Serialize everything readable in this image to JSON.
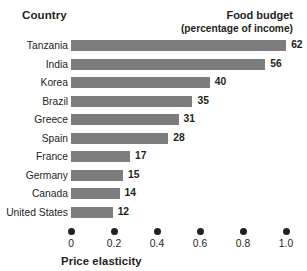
{
  "header": {
    "country_label": "Country",
    "budget_label_line1": "Food budget",
    "budget_label_line2": "(percentage of income)"
  },
  "axis": {
    "title": "Price elasticity",
    "tick_labels": [
      "0",
      "0.2",
      "0.4",
      "0.6",
      "0.8",
      "1.0"
    ]
  },
  "colors": {
    "bar": "#7d7d7d",
    "text": "#231f20",
    "background": "#ffffff"
  },
  "chart_data": {
    "type": "bar",
    "orientation": "horizontal",
    "title": "",
    "xlabel": "Price elasticity",
    "ylabel": "Country",
    "value_axis_label": "Food budget (percentage of income)",
    "categories": [
      "Tanzania",
      "India",
      "Korea",
      "Brazil",
      "Greece",
      "Spain",
      "France",
      "Germany",
      "Canada",
      "United States"
    ],
    "values": [
      62,
      56,
      40,
      35,
      31,
      28,
      17,
      15,
      14,
      12
    ],
    "value_labels": [
      "62",
      "56",
      "40",
      "35",
      "31",
      "28",
      "17",
      "15",
      "14",
      "12"
    ],
    "xlim": [
      0,
      1.0
    ],
    "xticks": [
      0,
      0.2,
      0.4,
      0.6,
      0.8,
      1.0
    ],
    "xtick_labels": [
      "0",
      "0.2",
      "0.4",
      "0.6",
      "0.8",
      "1.0"
    ],
    "grid": false,
    "legend": "none",
    "series": [
      {
        "name": "Food budget (percentage of income)",
        "values": [
          62,
          56,
          40,
          35,
          31,
          28,
          17,
          15,
          14,
          12
        ]
      }
    ]
  }
}
